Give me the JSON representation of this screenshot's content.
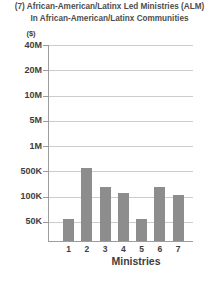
{
  "header": {
    "title_line1": "(7) African-American/Latinx Led Ministries (ALM)",
    "title_line2": "In African-American/Latinx Communities"
  },
  "chart_data": {
    "type": "bar",
    "title": "(7) African-American/Latinx Led Ministries (ALM) In African-American/Latinx Communities",
    "unit_label": "($)",
    "xlabel": "Ministries",
    "categories": [
      "1",
      "2",
      "3",
      "4",
      "5",
      "6",
      "7"
    ],
    "values": [
      55000,
      550000,
      180000,
      130000,
      55000,
      180000,
      110000
    ],
    "y_axis_ticks": [
      "40M",
      "20M",
      "10M",
      "5M",
      "1M",
      "500K",
      "100K",
      "50K"
    ],
    "y_axis_tick_values": [
      40000000,
      20000000,
      10000000,
      5000000,
      1000000,
      500000,
      100000,
      50000
    ],
    "scale": "log-like, equal spacing between labeled ticks",
    "grid": true,
    "legend": false,
    "bar_color": "#8d8d8d"
  },
  "colors": {
    "bar": "#8d8d8d",
    "gridline": "#cccccc",
    "axis": "#9c9c9c",
    "label_text": "#3e3e3e",
    "title_text": "#4d4d4d",
    "background": "#ffffff"
  }
}
